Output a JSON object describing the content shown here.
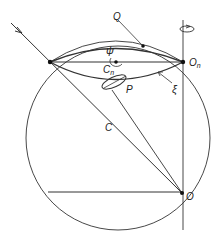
{
  "figure": {
    "labels": {
      "Q": "Q",
      "psi": "ψ",
      "Cn": "C",
      "Cn_sub": "n",
      "On": "O",
      "On_sub": "n",
      "xi": "ξ",
      "P": "P",
      "C": "C",
      "O": "O"
    },
    "colors": {
      "stroke": "#333333",
      "background": "#ffffff"
    }
  }
}
